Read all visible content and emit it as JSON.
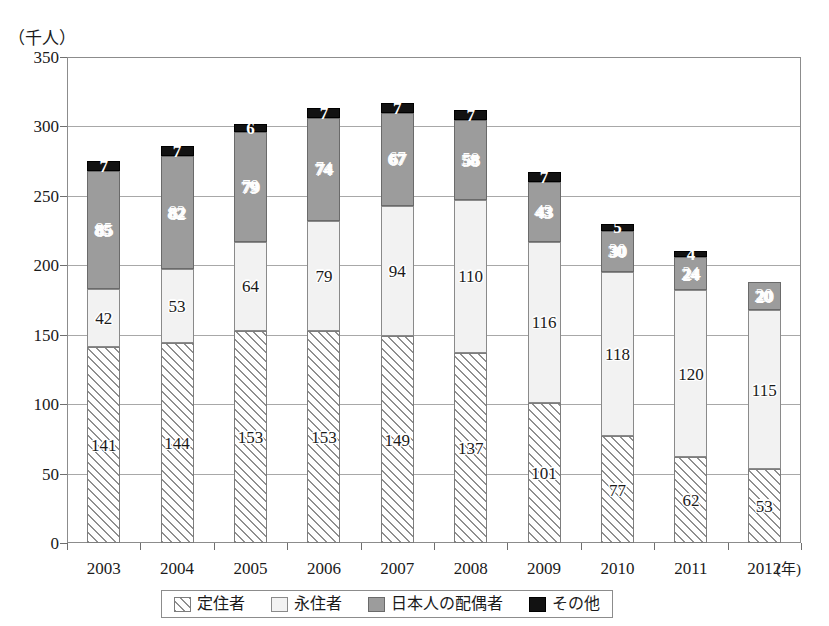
{
  "chart_data": {
    "type": "bar",
    "stacked": true,
    "title": "",
    "subtitle": "",
    "xlabel": "年",
    "ylabel": "（千人）",
    "ylim": [
      0,
      350
    ],
    "ytick_step": 50,
    "yticks": [
      "0",
      "50",
      "100",
      "150",
      "200",
      "250",
      "300",
      "350"
    ],
    "grid": true,
    "legend_position": "bottom",
    "categories": [
      "2003",
      "2004",
      "2005",
      "2006",
      "2007",
      "2008",
      "2009",
      "2010",
      "2011",
      "2012"
    ],
    "series": [
      {
        "name": "定住者",
        "fill": "hatched",
        "color": "#ffffff",
        "label_style": "dark",
        "values": [
          141,
          144,
          153,
          153,
          149,
          137,
          101,
          77,
          62,
          53
        ],
        "labels": [
          "141",
          "144",
          "153",
          "153",
          "149",
          "137",
          "101",
          "77",
          "62",
          "53"
        ]
      },
      {
        "name": "永住者",
        "fill": "light",
        "color": "#f2f2f2",
        "label_style": "dark",
        "values": [
          42,
          53,
          64,
          79,
          94,
          110,
          116,
          118,
          120,
          115
        ],
        "labels": [
          "42",
          "53",
          "64",
          "79",
          "94",
          "110",
          "116",
          "118",
          "120",
          "115"
        ]
      },
      {
        "name": "日本人の配偶者",
        "fill": "gray",
        "color": "#9c9c9c",
        "label_style": "light",
        "values": [
          85,
          82,
          79,
          74,
          67,
          58,
          43,
          30,
          24,
          20
        ],
        "labels": [
          "85",
          "82",
          "79",
          "74",
          "67",
          "58",
          "43",
          "30",
          "24",
          "20"
        ]
      },
      {
        "name": "その他",
        "fill": "black",
        "color": "#121212",
        "label_style": "onblack",
        "values": [
          7,
          7,
          6,
          7,
          7,
          7,
          7,
          5,
          4,
          0
        ],
        "labels": [
          "7",
          "7",
          "6",
          "7",
          "7",
          "7",
          "7",
          "5",
          "4",
          ""
        ]
      }
    ],
    "totals": [
      275,
      286,
      302,
      313,
      317,
      312,
      267,
      230,
      210,
      188
    ]
  },
  "legend": {
    "items": [
      {
        "label": "定住者",
        "swatch": "hatched-swatch"
      },
      {
        "label": "永住者",
        "swatch": "white-swatch"
      },
      {
        "label": "日本人の配偶者",
        "swatch": "gray-swatch"
      },
      {
        "label": "その他",
        "swatch": "black-swatch"
      }
    ]
  },
  "axis": {
    "y_unit_caption": "（千人）",
    "x_unit_caption": "(年)"
  }
}
